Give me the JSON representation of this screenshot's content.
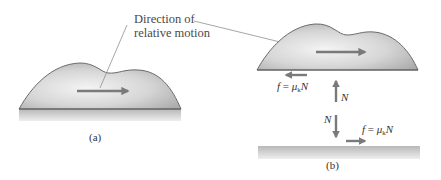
{
  "figure": {
    "annotation": {
      "line1": "Direction of",
      "line2": "relative motion"
    },
    "panels": [
      {
        "id": "a",
        "label": "(a)",
        "description": "Block sliding on surface with relative-motion arrow"
      },
      {
        "id": "b",
        "label": "(b)",
        "description": "Free-body view: block lifted off surface showing friction and normal force pairs"
      }
    ],
    "forces": {
      "friction_on_block": {
        "symbol": "f",
        "equals": " = ",
        "mu": "μ",
        "subscript": "k",
        "normal": "N",
        "direction": "left"
      },
      "normal_on_block": {
        "symbol": "N",
        "direction": "up"
      },
      "normal_on_surface": {
        "symbol": "N",
        "direction": "down"
      },
      "friction_on_surface": {
        "symbol": "f",
        "equals": " = ",
        "mu": "μ",
        "subscript": "k",
        "normal": "N",
        "direction": "right"
      }
    },
    "colors": {
      "block_fill_light": "#ececec",
      "block_fill_dark": "#b9b9b9",
      "block_outline": "#6b6b6b",
      "arrow": "#7a7a7a",
      "floor_top": "#b5b5b5",
      "floor_bottom": "#e8e8e8",
      "leader_line": "#8a8a8a",
      "text": "#3a3a3a"
    }
  }
}
